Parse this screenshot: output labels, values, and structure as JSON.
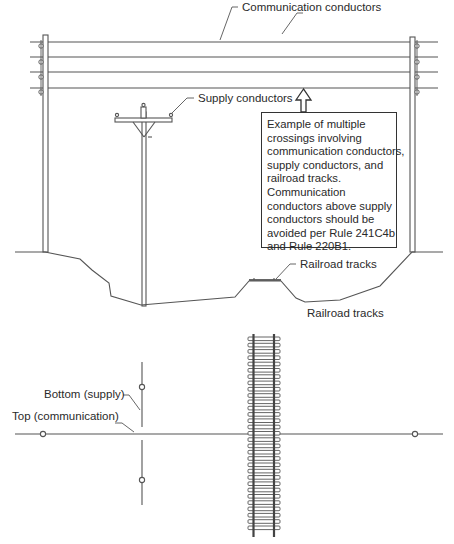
{
  "diagram": {
    "title": "Multiple crossings involving communication conductors, supply conductors, and railroad tracks",
    "elevation_view": {
      "labels": {
        "communication_conductors": "Communication conductors",
        "supply_conductors": "Supply conductors",
        "railroad_tracks": "Railroad tracks"
      },
      "callout": {
        "lines": [
          "Example of multiple",
          "crossings involving",
          "communication conductors,",
          "supply conductors, and",
          "railroad tracks.",
          "Communication",
          "conductors above supply",
          "conductors should be",
          "avoided per Rule 241C4b",
          "and Rule 220B1."
        ]
      },
      "communication_conductor_count": 4
    },
    "plan_view": {
      "labels": {
        "railroad_tracks": "Railroad tracks",
        "bottom_supply": "Bottom (supply)",
        "top_communication": "Top (communication)"
      }
    },
    "colors": {
      "line": "#555555",
      "text": "#2a2a2a",
      "background": "#ffffff"
    }
  }
}
